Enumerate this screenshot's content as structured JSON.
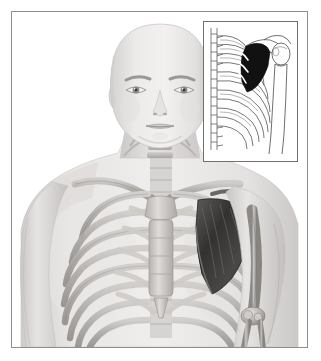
{
  "illustration": {
    "title": "Anterior view of human head and upper torso with skeletal overlay",
    "subject_description": "Bald human figure, front view, semi-transparent skin revealing rib cage, sternum, clavicles, cervical spine, scapula and arm bones",
    "view": "anterior",
    "highlighted_structure": "left scapula",
    "highlight_color": "#3a3a3a",
    "style": "grayscale medical illustration",
    "frame": {
      "border_color": "#8e8e8e",
      "background_color": "#ffffff"
    },
    "parts": [
      {
        "name": "head",
        "label": "Head"
      },
      {
        "name": "face",
        "label": "Face"
      },
      {
        "name": "neck",
        "label": "Neck"
      },
      {
        "name": "cervical-spine",
        "label": "Cervical vertebrae"
      },
      {
        "name": "clavicle-right",
        "label": "Right clavicle"
      },
      {
        "name": "clavicle-left",
        "label": "Left clavicle"
      },
      {
        "name": "sternum",
        "label": "Sternum"
      },
      {
        "name": "manubrium",
        "label": "Manubrium"
      },
      {
        "name": "xiphoid-process",
        "label": "Xiphoid process"
      },
      {
        "name": "rib-cage",
        "label": "Rib cage"
      },
      {
        "name": "costal-cartilage",
        "label": "Costal cartilage"
      },
      {
        "name": "scapula-left",
        "label": "Left scapula"
      },
      {
        "name": "humerus-left",
        "label": "Left humerus"
      },
      {
        "name": "elbow-joint-left",
        "label": "Left elbow joint"
      },
      {
        "name": "radius-left",
        "label": "Left radius"
      },
      {
        "name": "ulna-left",
        "label": "Left ulna"
      },
      {
        "name": "shoulder-right",
        "label": "Right shoulder"
      },
      {
        "name": "arm-right",
        "label": "Right arm"
      },
      {
        "name": "torso",
        "label": "Torso"
      }
    ],
    "colors": {
      "skin_light": "#eceaea",
      "skin_mid": "#dcd9d9",
      "skin_shadow": "#c4c1c1",
      "bone_light": "#d9d6d4",
      "bone_mid": "#b9b5b2",
      "bone_dark": "#8f8b88",
      "outline": "#6f6f6f",
      "highlight_dark": "#3a3a3a",
      "background": "#ffffff"
    }
  },
  "inset": {
    "title": "Lateral view detail of rib cage and scapula",
    "view": "lateral",
    "style": "black and white line drawing",
    "highlighted_structure": "scapula",
    "highlight_fill": "#111111",
    "border_color": "#6f6f6f",
    "parts": [
      {
        "name": "thoracic-spine",
        "label": "Thoracic vertebrae"
      },
      {
        "name": "ribs-lateral",
        "label": "Ribs (lateral)"
      },
      {
        "name": "scapula-filled",
        "label": "Scapula (shaded)"
      },
      {
        "name": "clavicle-lateral",
        "label": "Clavicle"
      },
      {
        "name": "humerus-lateral",
        "label": "Humerus"
      },
      {
        "name": "humeral-head",
        "label": "Head of humerus"
      }
    ]
  }
}
